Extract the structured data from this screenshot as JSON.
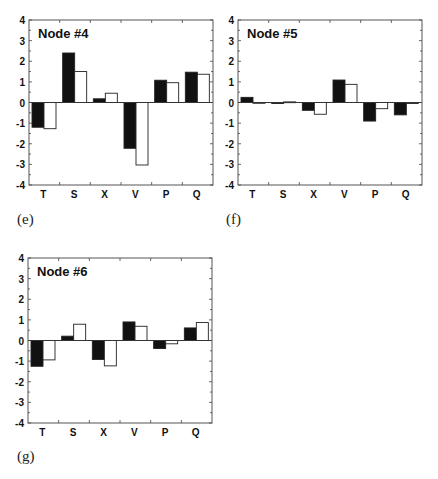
{
  "figure": {
    "panels": [
      {
        "caption": "(e)",
        "title": "Node #4"
      },
      {
        "caption": "(f)",
        "title": "Node #5"
      },
      {
        "caption": "(g)",
        "title": "Node #6"
      }
    ]
  },
  "chart_data": [
    {
      "type": "bar",
      "title": "Node #4",
      "panel_label": "(e)",
      "categories": [
        "T",
        "S",
        "X",
        "V",
        "P",
        "Q"
      ],
      "series": [
        {
          "name": "black",
          "color": "#111111",
          "values": [
            -1.2,
            2.4,
            0.18,
            -2.22,
            1.08,
            1.47
          ]
        },
        {
          "name": "white",
          "color": "#ffffff",
          "values": [
            -1.27,
            1.5,
            0.45,
            -3.03,
            0.96,
            1.37
          ]
        }
      ],
      "xlabel": "",
      "ylabel": "",
      "ylim": [
        -4,
        4
      ],
      "yticks": [
        4,
        3,
        2,
        1,
        0,
        -1,
        -2,
        -3,
        -4
      ],
      "grid": false,
      "legend": "none"
    },
    {
      "type": "bar",
      "title": "Node #5",
      "panel_label": "(f)",
      "categories": [
        "T",
        "S",
        "X",
        "V",
        "P",
        "Q"
      ],
      "series": [
        {
          "name": "black",
          "color": "#111111",
          "values": [
            0.25,
            -0.05,
            -0.38,
            1.09,
            -0.9,
            -0.6
          ]
        },
        {
          "name": "white",
          "color": "#ffffff",
          "values": [
            -0.03,
            0.03,
            -0.57,
            0.88,
            -0.3,
            -0.05
          ]
        }
      ],
      "xlabel": "",
      "ylabel": "",
      "ylim": [
        -4,
        4
      ],
      "yticks": [
        4,
        3,
        2,
        1,
        0,
        -1,
        -2,
        -3,
        -4
      ],
      "grid": false,
      "legend": "none"
    },
    {
      "type": "bar",
      "title": "Node #6",
      "panel_label": "(g)",
      "categories": [
        "T",
        "S",
        "X",
        "V",
        "P",
        "Q"
      ],
      "series": [
        {
          "name": "black",
          "color": "#111111",
          "values": [
            -1.25,
            0.21,
            -0.92,
            0.9,
            -0.39,
            0.61
          ]
        },
        {
          "name": "white",
          "color": "#ffffff",
          "values": [
            -0.94,
            0.79,
            -1.23,
            0.69,
            -0.16,
            0.87
          ]
        }
      ],
      "xlabel": "",
      "ylabel": "",
      "ylim": [
        -4,
        4
      ],
      "yticks": [
        4,
        3,
        2,
        1,
        0,
        -1,
        -2,
        -3,
        -4
      ],
      "grid": false,
      "legend": "none"
    }
  ]
}
